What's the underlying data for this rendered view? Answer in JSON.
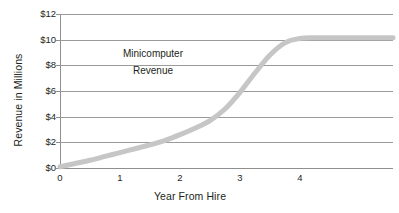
{
  "chart_data": {
    "type": "line",
    "title": "",
    "subtitle": "",
    "xlabel": "Year From Hire",
    "ylabel": "Revenue in Millions",
    "xlim": [
      0,
      5.55
    ],
    "ylim": [
      0,
      12
    ],
    "grid": true,
    "legend_position": "none",
    "x_ticks": [
      {
        "value": 0,
        "label": "0"
      },
      {
        "value": 1,
        "label": "1"
      },
      {
        "value": 2,
        "label": "2"
      },
      {
        "value": 3,
        "label": "3"
      },
      {
        "value": 4,
        "label": "4"
      }
    ],
    "y_ticks": [
      {
        "value": 0,
        "label": "$0"
      },
      {
        "value": 2,
        "label": "$2"
      },
      {
        "value": 4,
        "label": "$4"
      },
      {
        "value": 6,
        "label": "$6"
      },
      {
        "value": 8,
        "label": "$8"
      },
      {
        "value": 10,
        "label": "$10"
      },
      {
        "value": 12,
        "label": "$12"
      }
    ],
    "annotations": [
      {
        "text": "Minicomputer",
        "x": 1.55,
        "y": 8.9
      },
      {
        "text": "Revenue",
        "x": 1.55,
        "y": 7.55
      }
    ],
    "series": [
      {
        "name": "Minicomputer Revenue",
        "color": "#c6c6c6",
        "line_width_px": 5,
        "x": [
          0,
          0.25,
          0.5,
          0.75,
          1,
          1.25,
          1.5,
          1.75,
          2,
          2.25,
          2.5,
          2.75,
          3,
          3.25,
          3.5,
          3.75,
          4,
          4.25,
          4.5,
          4.75,
          5,
          5.25,
          5.55
        ],
        "values": [
          0.1,
          0.35,
          0.6,
          0.9,
          1.2,
          1.5,
          1.8,
          2.15,
          2.6,
          3.1,
          3.7,
          4.6,
          5.9,
          7.4,
          8.8,
          9.75,
          10.1,
          10.15,
          10.15,
          10.15,
          10.15,
          10.15,
          10.15
        ]
      }
    ]
  },
  "axes": {
    "y_title": "Revenue in Millions",
    "x_title": "Year From Hire"
  },
  "colors": {
    "series": "#c6c6c6",
    "gridline": "#9a9a9a",
    "axis": "#8f8f8f",
    "text": "#231f20",
    "background": "#ffffff"
  }
}
